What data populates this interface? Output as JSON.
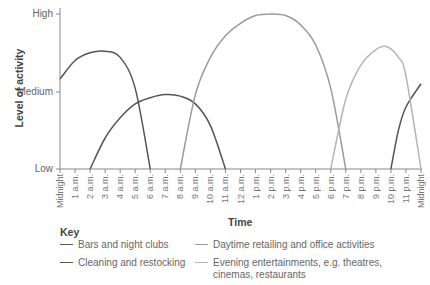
{
  "chart_data": {
    "type": "line",
    "title": "",
    "xlabel": "Time",
    "ylabel": "Level of activity",
    "y_ticks": [
      "Low",
      "Medium",
      "High"
    ],
    "y_scale": {
      "Low": 0,
      "Medium": 50,
      "High": 100
    },
    "ylim": [
      0,
      100
    ],
    "x_ticks": [
      "Midnight",
      "1 a.m.",
      "2 a.m.",
      "3 a.m.",
      "4 a.m.",
      "5 a.m.",
      "6 a.m.",
      "7 a.m.",
      "8 a.m.",
      "9 a.m.",
      "10 a.m.",
      "11 a.m.",
      "12 a.m.",
      "1 p.m.",
      "2 p.m.",
      "3 p.m.",
      "4 p.m.",
      "5 p.m.",
      "6 p.m.",
      "7 p.m.",
      "8 p.m.",
      "9 p.m.",
      "10 p.m.",
      "11 p.m.",
      "Midnight"
    ],
    "x_unit": "hours from midnight (0-24)",
    "grid": false,
    "legend_position": "bottom",
    "legend_title": "Key",
    "series": [
      {
        "name": "Bars and night clubs",
        "color": "#555555",
        "points": [
          [
            0,
            58
          ],
          [
            1,
            70
          ],
          [
            2,
            75
          ],
          [
            3,
            76
          ],
          [
            4,
            72
          ],
          [
            5,
            52
          ],
          [
            6,
            0
          ]
        ]
      },
      {
        "name": "Cleaning and restocking",
        "color": "#555555",
        "points": [
          [
            2,
            0
          ],
          [
            3,
            20
          ],
          [
            4,
            33
          ],
          [
            5,
            42
          ],
          [
            6,
            46
          ],
          [
            7,
            48
          ],
          [
            8,
            47
          ],
          [
            9,
            42
          ],
          [
            10,
            28
          ],
          [
            11,
            0
          ]
        ]
      },
      {
        "name": "Cleaning and restocking (late)",
        "color": "#555555",
        "legend": false,
        "points": [
          [
            22,
            0
          ],
          [
            22.5,
            25
          ],
          [
            23,
            40
          ],
          [
            24,
            55
          ]
        ]
      },
      {
        "name": "Daytime retailing and office activities",
        "color": "#9a9a9a",
        "points": [
          [
            8,
            0
          ],
          [
            9,
            48
          ],
          [
            10,
            72
          ],
          [
            11,
            86
          ],
          [
            12,
            94
          ],
          [
            13,
            99
          ],
          [
            14,
            100
          ],
          [
            15,
            99
          ],
          [
            16,
            93
          ],
          [
            17,
            80
          ],
          [
            18,
            52
          ],
          [
            19,
            0
          ]
        ]
      },
      {
        "name": "Evening entertainments, e.g. theatres, cinemas, restaurants",
        "color": "#b5b5b5",
        "points": [
          [
            18,
            0
          ],
          [
            19,
            45
          ],
          [
            20,
            67
          ],
          [
            21,
            77
          ],
          [
            21.7,
            79
          ],
          [
            22.5,
            72
          ],
          [
            23,
            60
          ],
          [
            24,
            0
          ]
        ]
      }
    ]
  },
  "legend": {
    "title": "Key",
    "items": [
      {
        "label": "Bars and night clubs",
        "color": "#555555"
      },
      {
        "label": "Cleaning and restocking",
        "color": "#555555"
      },
      {
        "label": "Daytime retailing and office activities",
        "color": "#9a9a9a"
      },
      {
        "label_line1": "Evening entertainments, e.g. theatres,",
        "label_line2": "cinemas, restaurants",
        "color": "#b5b5b5"
      }
    ]
  }
}
